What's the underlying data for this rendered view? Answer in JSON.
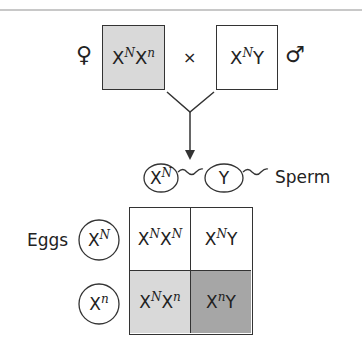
{
  "colors": {
    "female_box": "#d9d9d9",
    "male_box": "#ffffff",
    "cell_white": "#ffffff",
    "cell_light": "#d9d9d9",
    "cell_dark": "#a6a6a6",
    "line": "#333333",
    "top_rule": "#c8c8c8"
  },
  "parents": {
    "female_symbol": "♀",
    "female": {
      "base1": "X",
      "sup1": "N",
      "base2": "X",
      "sup2": "n"
    },
    "cross": "×",
    "male": {
      "base1": "X",
      "sup1": "N",
      "base2": "Y"
    },
    "male_symbol": "♂"
  },
  "sperm": {
    "label": "Sperm",
    "items": [
      {
        "base": "X",
        "sup": "N"
      },
      {
        "base": "Y",
        "sup": ""
      }
    ]
  },
  "eggs": {
    "label": "Eggs",
    "items": [
      {
        "base": "X",
        "sup": "N"
      },
      {
        "base": "X",
        "sup": "n"
      }
    ]
  },
  "punnett": {
    "cells": [
      {
        "b1": "X",
        "s1": "N",
        "b2": "X",
        "s2": "N"
      },
      {
        "b1": "X",
        "s1": "N",
        "b2": "Y",
        "s2": ""
      },
      {
        "b1": "X",
        "s1": "N",
        "b2": "X",
        "s2": "n"
      },
      {
        "b1": "X",
        "s1": "n",
        "b2": "Y",
        "s2": ""
      }
    ]
  }
}
